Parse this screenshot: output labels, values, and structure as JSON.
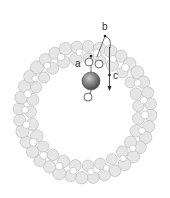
{
  "diagram": {
    "type": "granular-ring-with-intruder",
    "ring": {
      "center": [
        85,
        112
      ],
      "outer_radius": 72,
      "inner_radius": 48,
      "grain_fill": "#e6e6e6",
      "grain_stroke": "#b5b5b5",
      "void_fill": "#ffffff"
    },
    "intruder": {
      "center": [
        91,
        81
      ],
      "radius": 9,
      "fill_light": "#bdbdbd",
      "fill_dark": "#5a5a5a"
    },
    "small_particles": [
      {
        "cx": 89,
        "cy": 62,
        "r": 4
      },
      {
        "cx": 99,
        "cy": 64,
        "r": 4
      },
      {
        "cx": 88,
        "cy": 97,
        "r": 4
      }
    ],
    "labels": {
      "a": "a",
      "b": "b",
      "c": "c"
    },
    "arrow": {
      "from": [
        109,
        47
      ],
      "to": [
        110,
        90
      ]
    }
  }
}
